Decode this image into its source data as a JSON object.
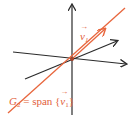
{
  "diagram": {
    "colors": {
      "axes": "#2b2b2b",
      "subspace_line": "#e8663d",
      "background": "#ffffff"
    },
    "axes": [
      {
        "name": "vertical-axis",
        "from": [
          72,
          115
        ],
        "to": [
          72,
          4
        ]
      },
      {
        "name": "horizontal-axis",
        "from": [
          13,
          52
        ],
        "to": [
          127,
          64
        ]
      },
      {
        "name": "diagonal-axis",
        "from": [
          25,
          79
        ],
        "to": [
          118,
          41
        ]
      }
    ],
    "subspace_line": {
      "from": [
        8,
        113
      ],
      "to": [
        125,
        8
      ],
      "arrow_at": [
        104,
        29
      ]
    },
    "origin": [
      72,
      59
    ],
    "labels": {
      "vector_label": {
        "symbol": "v",
        "subscript": "1",
        "arrow": "→"
      },
      "span_label": {
        "prefix": "G",
        "prefix_subscript": "2",
        "equals": " = span {",
        "vector": "v",
        "vector_subscript": "1",
        "suffix": "}"
      }
    }
  }
}
